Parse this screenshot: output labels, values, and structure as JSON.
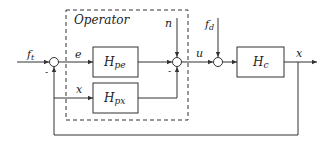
{
  "diagram": {
    "type": "block-diagram",
    "group": {
      "label": "Operator"
    },
    "blocks": [
      {
        "id": "Hpe",
        "main": "H",
        "sub": "pe"
      },
      {
        "id": "Hpx",
        "main": "H",
        "sub": "px"
      },
      {
        "id": "Hc",
        "main": "H",
        "sub": "c"
      }
    ],
    "signals": {
      "ft": {
        "main": "f",
        "sub": "t"
      },
      "fd": {
        "main": "f",
        "sub": "d"
      },
      "e": "e",
      "x_in": "x",
      "n": "n",
      "u": "u",
      "x_out": "x"
    },
    "signs": {
      "sum1_feedback": "-",
      "sum2_hpe": "-"
    },
    "colors": {
      "line": "#333333",
      "background": "#ffffff"
    }
  }
}
